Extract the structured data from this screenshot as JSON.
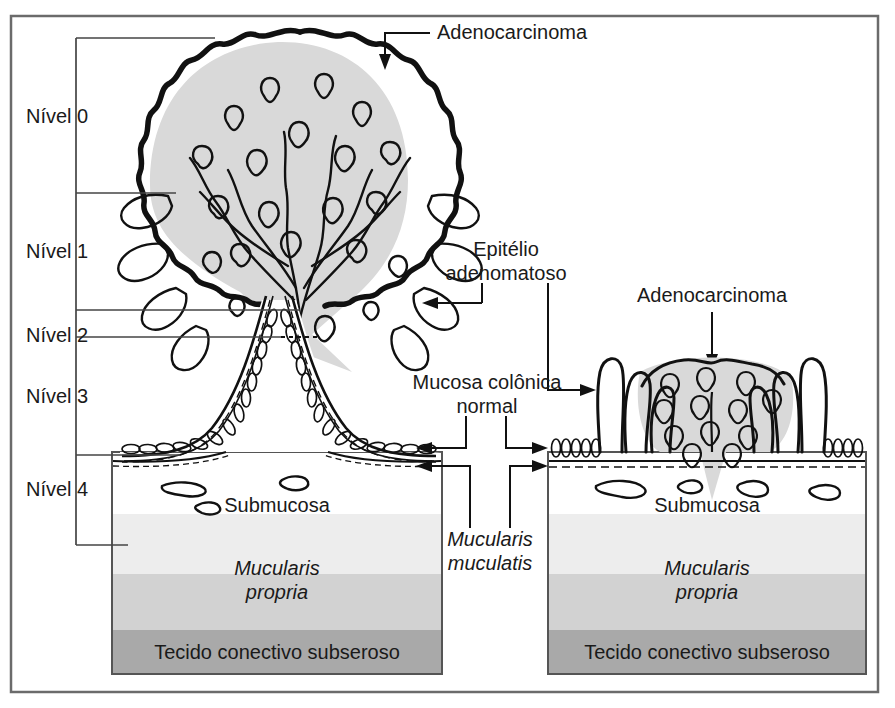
{
  "figure": {
    "frame_color": "#6b6b6b",
    "background": "#ffffff"
  },
  "levels": {
    "items": [
      {
        "id": "nivel-0",
        "label": "Nível 0"
      },
      {
        "id": "nivel-1",
        "label": "Nível 1"
      },
      {
        "id": "nivel-2",
        "label": "Nível 2"
      },
      {
        "id": "nivel-3",
        "label": "Nível 3"
      },
      {
        "id": "nivel-4",
        "label": "Nível 4"
      }
    ]
  },
  "annotations": {
    "adenocarcinoma_left": "Adenocarcinoma",
    "adenocarcinoma_right": "Adenocarcinoma",
    "epitelio_line1": "Epitélio",
    "epitelio_line2": "adenomatoso",
    "mucosa_line1": "Mucosa colônica",
    "mucosa_line2": "normal",
    "mucularis_line1": "Mucularis",
    "mucularis_line2": "muculatis"
  },
  "tissue_layers": {
    "left": {
      "submucosa": "Submucosa",
      "muscularis_line1": "Mucularis",
      "muscularis_line2": "propria",
      "subserosa": "Tecido conectivo subseroso"
    },
    "right": {
      "submucosa": "Submucosa",
      "muscularis_line1": "Mucularis",
      "muscularis_line2": "propria",
      "subserosa": "Tecido conectivo subseroso"
    }
  },
  "colors": {
    "carcinoma_shade": "#d9d9d9",
    "submucosa": "#ffffff",
    "muscularis_upper": "#ededed",
    "muscularis_lower": "#d2d2d2",
    "subserosa": "#a9a9a9",
    "outline": "#111111"
  }
}
